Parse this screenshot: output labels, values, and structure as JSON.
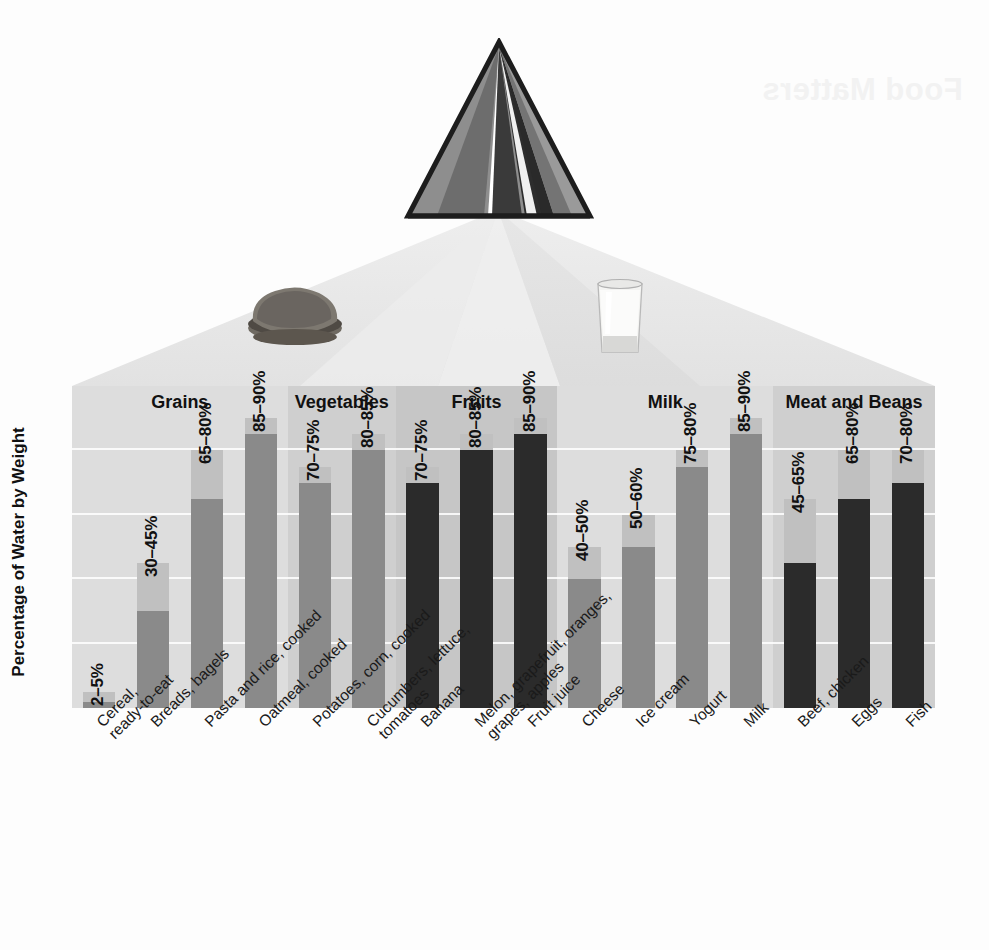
{
  "ghost_text": "Food Matters",
  "axis": {
    "y_title": "Percentage of Water by Weight"
  },
  "photos": [
    {
      "name": "bread-photo",
      "alt": "sandwich bread"
    },
    {
      "name": "milk-glass-photo",
      "alt": "glass of milk"
    }
  ],
  "pyramid": {
    "name": "food-guide-pyramid",
    "stripe_colors": [
      "#8e8e8e",
      "#6a6a6a",
      "#3b3b3b",
      "#4e4e4e",
      "#2a2a2a",
      "#6f6f6f"
    ]
  },
  "colors": {
    "band_light": "#dcdcdc",
    "band_dark": "#c9c9c9",
    "gridline": "#ffffff",
    "bar_light": "#c0c0c0",
    "bar_mid": "#8a8a8a",
    "bar_dark": "#2b2b2b",
    "text": "#111111"
  },
  "chart_data": {
    "type": "bar",
    "title": "",
    "xlabel": "",
    "ylabel": "Percentage of Water by Weight",
    "ylim": [
      0,
      100
    ],
    "grid": true,
    "gridline_values": [
      20,
      40,
      60,
      80
    ],
    "legend": "none",
    "note": "Each bar is a floating range: dark lower segment ends at the minimum percentage, lighter upper segment extends to the maximum percentage.",
    "groups": [
      {
        "label": "Grains",
        "band_shade": "light",
        "items": [
          {
            "category": "Cereal,\nready-to-eat",
            "range_label": "2–5%",
            "min": 2,
            "max": 5,
            "bar_color": "mid"
          },
          {
            "category": "Breads, bagels",
            "range_label": "30–45%",
            "min": 30,
            "max": 45,
            "bar_color": "mid"
          },
          {
            "category": "Pasta and rice, cooked",
            "range_label": "65–80%",
            "min": 65,
            "max": 80,
            "bar_color": "mid"
          },
          {
            "category": "Oatmeal, cooked",
            "range_label": "85–90%",
            "min": 85,
            "max": 90,
            "bar_color": "mid"
          }
        ]
      },
      {
        "label": "Vegetables",
        "band_shade": "dark",
        "items": [
          {
            "category": "Potatoes, corn, cooked",
            "range_label": "70–75%",
            "min": 70,
            "max": 75,
            "bar_color": "mid"
          },
          {
            "category": "Cucumbers, lettuce,\ntomatoes",
            "range_label": "80–85%",
            "min": 80,
            "max": 85,
            "bar_color": "mid"
          }
        ]
      },
      {
        "label": "Fruits",
        "band_shade": "dark2",
        "items": [
          {
            "category": "Banana",
            "range_label": "70–75%",
            "min": 70,
            "max": 75,
            "bar_color": "dark"
          },
          {
            "category": "Melon, grapefruit, oranges,\ngrapes, apples",
            "range_label": "80–85%",
            "min": 80,
            "max": 85,
            "bar_color": "dark"
          },
          {
            "category": "Fruit juice",
            "range_label": "85–90%",
            "min": 85,
            "max": 90,
            "bar_color": "dark"
          }
        ]
      },
      {
        "label": "Milk",
        "band_shade": "light",
        "items": [
          {
            "category": "Cheese",
            "range_label": "40–50%",
            "min": 40,
            "max": 50,
            "bar_color": "mid"
          },
          {
            "category": "Ice cream",
            "range_label": "50–60%",
            "min": 50,
            "max": 60,
            "bar_color": "mid"
          },
          {
            "category": "Yogurt",
            "range_label": "75–80%",
            "min": 75,
            "max": 80,
            "bar_color": "mid"
          },
          {
            "category": "Milk",
            "range_label": "85–90%",
            "min": 85,
            "max": 90,
            "bar_color": "mid"
          }
        ]
      },
      {
        "label": "Meat and Beans",
        "band_shade": "dark",
        "items": [
          {
            "category": "Beef, chicken",
            "range_label": "45–65%",
            "min": 45,
            "max": 65,
            "bar_color": "dark"
          },
          {
            "category": "Eggs",
            "range_label": "65–80%",
            "min": 65,
            "max": 80,
            "bar_color": "dark"
          },
          {
            "category": "Fish",
            "range_label": "70–80%",
            "min": 70,
            "max": 80,
            "bar_color": "dark"
          }
        ]
      }
    ]
  }
}
